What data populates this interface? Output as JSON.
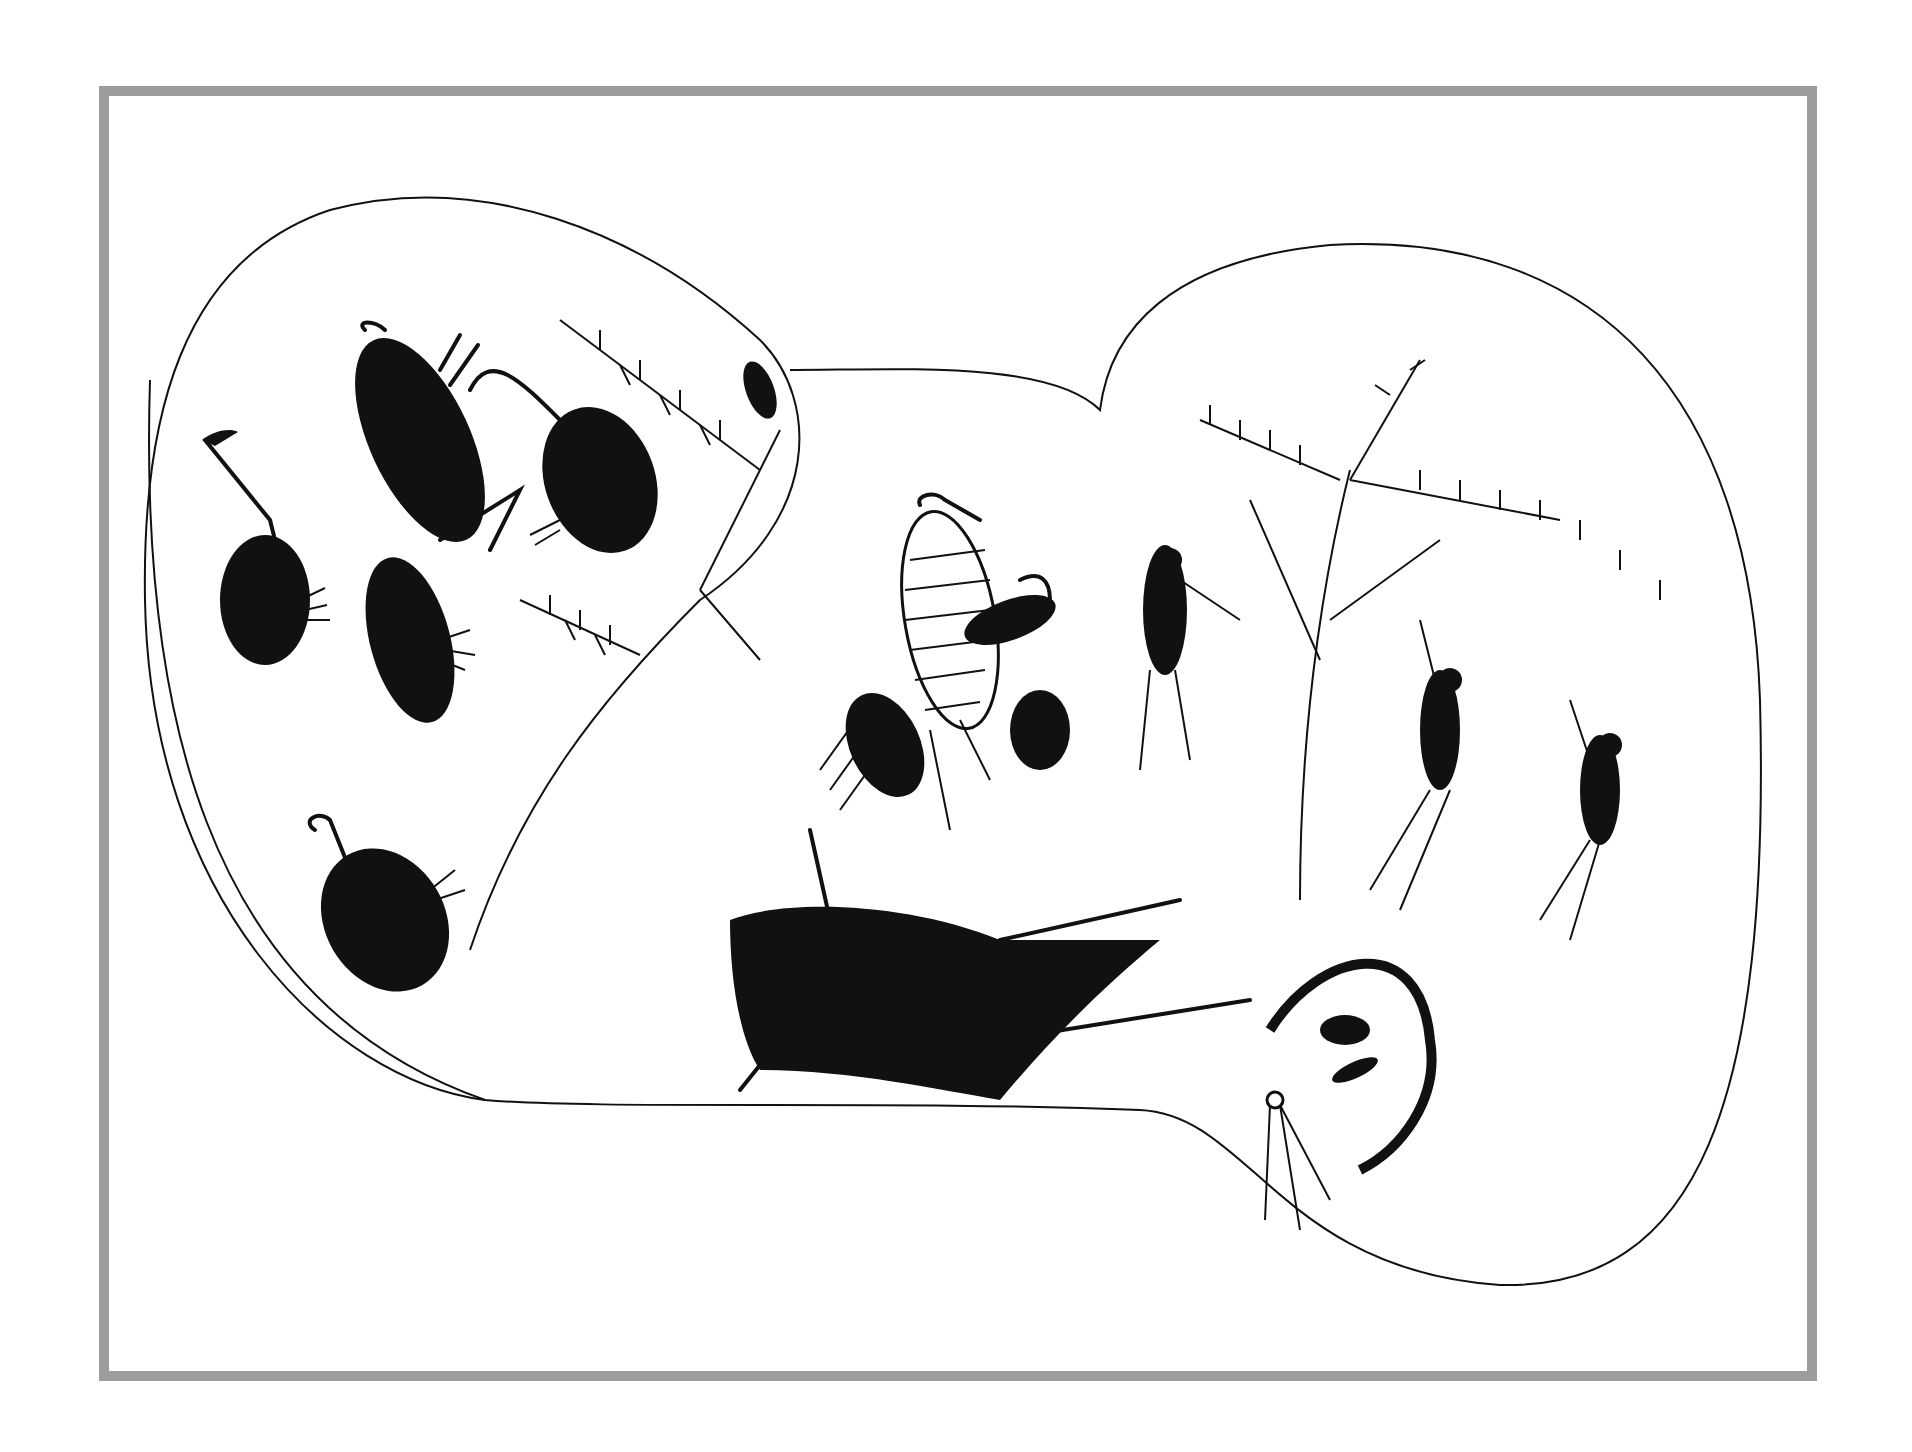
{
  "artwork": {
    "type": "ink drawing",
    "frame_color": "#9c9c9c",
    "ink_color": "#111111",
    "background": "#ffffff",
    "groups": [
      {
        "name": "left-lobe",
        "figures": [
          "emu-bird",
          "horned-animal",
          "emu-bird",
          "emu-bird",
          "emu-bird",
          "branch",
          "branch",
          "small-bird"
        ]
      },
      {
        "name": "center",
        "figures": [
          "striped-figure",
          "emu-bird",
          "emu-bird",
          "animal-skin"
        ]
      },
      {
        "name": "right-lobe",
        "figures": [
          "tree",
          "hunter",
          "hunter",
          "hunter",
          "shelter-with-figures",
          "spear-bundle"
        ]
      }
    ]
  }
}
